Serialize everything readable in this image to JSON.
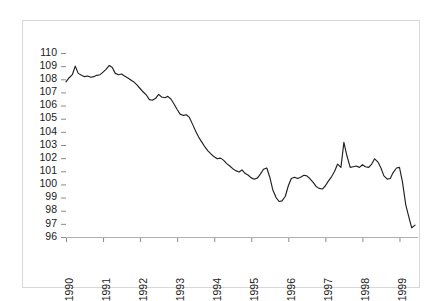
{
  "chart_data": {
    "type": "line",
    "title": "",
    "subtitle": "",
    "xlabel": "",
    "ylabel": "",
    "grid": false,
    "legend": "none",
    "ylim": [
      96,
      110
    ],
    "xlim": [
      1990.0,
      1999.5
    ],
    "ytick_labels": [
      "110",
      "109",
      "108",
      "107",
      "106",
      "105",
      "104",
      "103",
      "102",
      "101",
      "100",
      "99",
      "98",
      "97",
      "96"
    ],
    "ytick_values": [
      110,
      109,
      108,
      107,
      106,
      105,
      104,
      103,
      102,
      101,
      100,
      99,
      98,
      97,
      96
    ],
    "xtick_labels": [
      "1990",
      "1991",
      "1992",
      "1993",
      "1994",
      "1995",
      "1996",
      "1997",
      "1998",
      "1999"
    ],
    "xtick_values": [
      1990,
      1991,
      1992,
      1993,
      1994,
      1995,
      1996,
      1997,
      1998,
      1999
    ],
    "line_color": "#202020",
    "background_color": "#ffffff",
    "frame_color": "#d8d8d8",
    "series": [
      {
        "name": "index",
        "x": [
          1990.0,
          1990.08,
          1990.17,
          1990.25,
          1990.33,
          1990.42,
          1990.5,
          1990.58,
          1990.67,
          1990.75,
          1990.83,
          1990.92,
          1991.0,
          1991.08,
          1991.17,
          1991.25,
          1991.33,
          1991.42,
          1991.5,
          1991.58,
          1991.67,
          1991.75,
          1991.83,
          1991.92,
          1992.0,
          1992.08,
          1992.17,
          1992.25,
          1992.33,
          1992.42,
          1992.5,
          1992.58,
          1992.67,
          1992.75,
          1992.83,
          1992.92,
          1993.0,
          1993.08,
          1993.17,
          1993.25,
          1993.33,
          1993.42,
          1993.5,
          1993.58,
          1993.67,
          1993.75,
          1993.83,
          1993.92,
          1994.0,
          1994.08,
          1994.17,
          1994.25,
          1994.33,
          1994.42,
          1994.5,
          1994.58,
          1994.67,
          1994.75,
          1994.83,
          1994.92,
          1995.0,
          1995.08,
          1995.17,
          1995.25,
          1995.33,
          1995.42,
          1995.5,
          1995.58,
          1995.67,
          1995.75,
          1995.83,
          1995.92,
          1996.0,
          1996.08,
          1996.17,
          1996.25,
          1996.33,
          1996.42,
          1996.5,
          1996.58,
          1996.67,
          1996.75,
          1996.83,
          1996.92,
          1997.0,
          1997.08,
          1997.17,
          1997.25,
          1997.33,
          1997.42,
          1997.5,
          1997.58,
          1997.67,
          1997.75,
          1997.83,
          1997.92,
          1998.0,
          1998.08,
          1998.17,
          1998.25,
          1998.33,
          1998.42,
          1998.5,
          1998.58,
          1998.67,
          1998.75,
          1998.83,
          1998.92,
          1999.0,
          1999.08,
          1999.17,
          1999.25,
          1999.33,
          1999.42
        ],
        "values": [
          107.8,
          108.1,
          108.35,
          109.0,
          108.45,
          108.3,
          108.2,
          108.25,
          108.15,
          108.2,
          108.3,
          108.35,
          108.55,
          108.75,
          109.05,
          108.9,
          108.45,
          108.35,
          108.4,
          108.25,
          108.1,
          107.95,
          107.8,
          107.55,
          107.3,
          107.05,
          106.8,
          106.45,
          106.4,
          106.55,
          106.85,
          106.65,
          106.6,
          106.7,
          106.5,
          106.1,
          105.7,
          105.35,
          105.25,
          105.3,
          105.1,
          104.55,
          104.05,
          103.6,
          103.2,
          102.85,
          102.55,
          102.3,
          102.1,
          101.95,
          102.0,
          101.85,
          101.6,
          101.4,
          101.2,
          101.05,
          100.95,
          101.1,
          100.85,
          100.7,
          100.5,
          100.4,
          100.5,
          100.8,
          101.15,
          101.25,
          100.55,
          99.6,
          99.0,
          98.7,
          98.75,
          99.1,
          99.9,
          100.45,
          100.55,
          100.45,
          100.55,
          100.7,
          100.65,
          100.45,
          100.15,
          99.85,
          99.7,
          99.65,
          99.9,
          100.25,
          100.6,
          101.0,
          101.55,
          101.3,
          103.2,
          102.2,
          101.3,
          101.35,
          101.4,
          101.3,
          101.5,
          101.35,
          101.3,
          101.55,
          101.95,
          101.7,
          101.25,
          100.65,
          100.4,
          100.45,
          100.9,
          101.25,
          101.3,
          100.2,
          98.45,
          97.55,
          96.7,
          96.9
        ]
      }
    ]
  }
}
